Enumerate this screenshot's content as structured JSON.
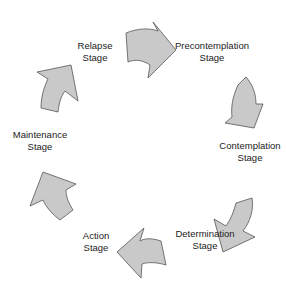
{
  "diagram": {
    "colors": {
      "arrow_fill": "#c9c9c9",
      "arrow_stroke": "#555555",
      "text": "#222222"
    },
    "stages": [
      {
        "line1": "Precontemplation",
        "line2": "Stage",
        "x": 212,
        "y": 40
      },
      {
        "line1": "Contemplation",
        "line2": "Stage",
        "x": 250,
        "y": 140
      },
      {
        "line1": "Determination",
        "line2": "Stage",
        "x": 205,
        "y": 228
      },
      {
        "line1": "Action",
        "line2": "Stage",
        "x": 96,
        "y": 230
      },
      {
        "line1": "Maintenance",
        "line2": "Stage",
        "x": 40,
        "y": 129
      },
      {
        "line1": "Relapse",
        "line2": "Stage",
        "x": 95,
        "y": 40
      }
    ],
    "arrows": [
      {
        "name": "relapse-to-precontemplation",
        "direction": "right"
      },
      {
        "name": "precontemplation-to-contemplation",
        "direction": "down-right"
      },
      {
        "name": "contemplation-to-determination",
        "direction": "down-left"
      },
      {
        "name": "determination-to-action",
        "direction": "left"
      },
      {
        "name": "action-to-maintenance",
        "direction": "up"
      },
      {
        "name": "maintenance-to-relapse",
        "direction": "up-right"
      }
    ]
  }
}
